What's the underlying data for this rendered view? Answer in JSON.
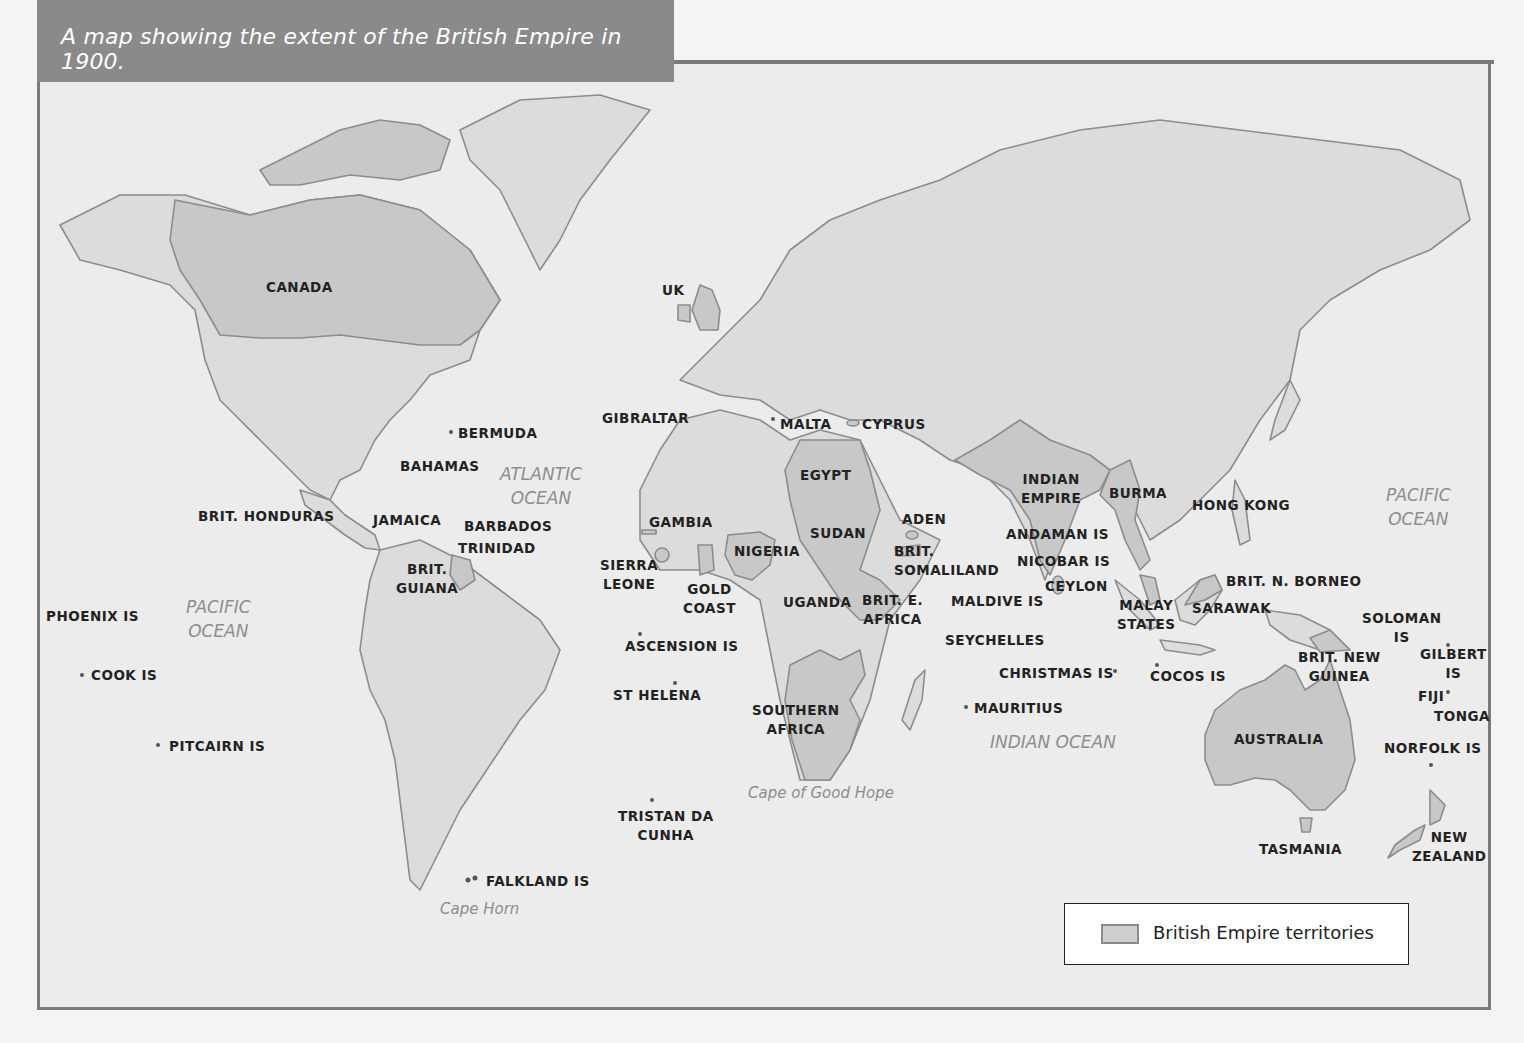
{
  "title": "A map showing the extent of the British Empire in 1900.",
  "legend": {
    "swatch_color": "#cfcfcf",
    "label": "British Empire territories"
  },
  "colors": {
    "land": "#dcdcdc",
    "empire": "#c8c8c8",
    "coast": "#8c8c8c",
    "sea": "#ececec",
    "frame": "#7a7a7a",
    "title_bg": "#8a8a8a"
  },
  "oceans": [
    {
      "id": "atlantic",
      "text": "ATLANTIC\nOCEAN"
    },
    {
      "id": "pacific-west",
      "text": "PACIFIC\nOCEAN"
    },
    {
      "id": "pacific-east",
      "text": "PACIFIC\nOCEAN"
    },
    {
      "id": "indian",
      "text": "INDIAN OCEAN"
    }
  ],
  "capes": [
    {
      "id": "good-hope",
      "text": "Cape of Good Hope"
    },
    {
      "id": "horn",
      "text": "Cape Horn"
    }
  ],
  "territories": [
    {
      "id": "canada",
      "text": "CANADA"
    },
    {
      "id": "uk",
      "text": "UK"
    },
    {
      "id": "bermuda",
      "text": "BERMUDA"
    },
    {
      "id": "bahamas",
      "text": "BAHAMAS"
    },
    {
      "id": "brit-honduras",
      "text": "BRIT. HONDURAS"
    },
    {
      "id": "jamaica",
      "text": "JAMAICA"
    },
    {
      "id": "barbados",
      "text": "BARBADOS"
    },
    {
      "id": "trinidad",
      "text": "TRINIDAD"
    },
    {
      "id": "brit-guiana",
      "text": "BRIT.\nGUIANA"
    },
    {
      "id": "phoenix",
      "text": "PHOENIX IS"
    },
    {
      "id": "cook",
      "text": "COOK IS"
    },
    {
      "id": "pitcairn",
      "text": "PITCAIRN IS"
    },
    {
      "id": "falkland",
      "text": "FALKLAND IS"
    },
    {
      "id": "gibraltar",
      "text": "GIBRALTAR"
    },
    {
      "id": "malta",
      "text": "MALTA"
    },
    {
      "id": "cyprus",
      "text": "CYPRUS"
    },
    {
      "id": "egypt",
      "text": "EGYPT"
    },
    {
      "id": "gambia",
      "text": "GAMBIA"
    },
    {
      "id": "sierra-leone",
      "text": "SIERRA\nLEONE"
    },
    {
      "id": "gold-coast",
      "text": "GOLD\nCOAST"
    },
    {
      "id": "nigeria",
      "text": "NIGERIA"
    },
    {
      "id": "sudan",
      "text": "SUDAN"
    },
    {
      "id": "aden",
      "text": "ADEN"
    },
    {
      "id": "brit-somaliland",
      "text": "BRIT.\nSOMALILAND"
    },
    {
      "id": "uganda",
      "text": "UGANDA"
    },
    {
      "id": "brit-e-africa",
      "text": "BRIT. E.\nAFRICA"
    },
    {
      "id": "ascension",
      "text": "ASCENSION IS"
    },
    {
      "id": "st-helena",
      "text": "ST HELENA"
    },
    {
      "id": "southern-africa",
      "text": "SOUTHERN\nAFRICA"
    },
    {
      "id": "tristan",
      "text": "TRISTAN DA\nCUNHA"
    },
    {
      "id": "seychelles",
      "text": "SEYCHELLES"
    },
    {
      "id": "maldive",
      "text": "MALDIVE IS"
    },
    {
      "id": "mauritius",
      "text": "MAURITIUS"
    },
    {
      "id": "indian-empire",
      "text": "INDIAN\nEMPIRE"
    },
    {
      "id": "burma",
      "text": "BURMA"
    },
    {
      "id": "andaman",
      "text": "ANDAMAN IS"
    },
    {
      "id": "nicobar",
      "text": "NICOBAR IS"
    },
    {
      "id": "ceylon",
      "text": "CEYLON"
    },
    {
      "id": "christmas",
      "text": "CHRISTMAS IS"
    },
    {
      "id": "cocos",
      "text": "COCOS IS"
    },
    {
      "id": "malay",
      "text": "MALAY\nSTATES"
    },
    {
      "id": "hong-kong",
      "text": "HONG KONG"
    },
    {
      "id": "brit-n-borneo",
      "text": "BRIT. N. BORNEO"
    },
    {
      "id": "sarawak",
      "text": "SARAWAK"
    },
    {
      "id": "brit-new-guinea",
      "text": "BRIT. NEW\nGUINEA"
    },
    {
      "id": "soloman",
      "text": "SOLOMAN\nIS"
    },
    {
      "id": "gilbert",
      "text": "GILBERT\nIS"
    },
    {
      "id": "fiji",
      "text": "FIJI"
    },
    {
      "id": "tonga",
      "text": "TONGA"
    },
    {
      "id": "australia",
      "text": "AUSTRALIA"
    },
    {
      "id": "norfolk",
      "text": "NORFOLK IS"
    },
    {
      "id": "tasmania",
      "text": "TASMANIA"
    },
    {
      "id": "new-zealand",
      "text": "NEW\nZEALAND"
    }
  ]
}
